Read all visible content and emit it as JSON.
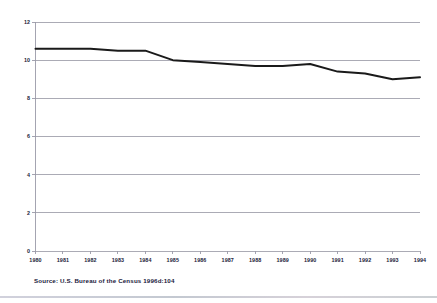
{
  "chart_data": {
    "type": "line",
    "title": "",
    "subtitle": "",
    "xlabel": "",
    "ylabel": "",
    "categories": [
      "1980",
      "1981",
      "1982",
      "1983",
      "1984",
      "1985",
      "1986",
      "1987",
      "1988",
      "1989",
      "1990",
      "1991",
      "1992",
      "1993",
      "1994"
    ],
    "x": [
      1980,
      1981,
      1982,
      1983,
      1984,
      1985,
      1986,
      1987,
      1988,
      1989,
      1990,
      1991,
      1992,
      1993,
      1994
    ],
    "values": [
      10.6,
      10.6,
      10.6,
      10.5,
      10.5,
      10.0,
      9.9,
      9.8,
      9.7,
      9.7,
      9.8,
      9.4,
      9.3,
      9.0,
      9.1
    ],
    "series": [
      {
        "name": "rate",
        "values": [
          10.6,
          10.6,
          10.6,
          10.5,
          10.5,
          10.0,
          9.9,
          9.8,
          9.7,
          9.7,
          9.8,
          9.4,
          9.3,
          9.0,
          9.1
        ]
      }
    ],
    "ylim": [
      0,
      12
    ],
    "yticks": [
      0,
      2,
      4,
      6,
      8,
      10,
      12
    ],
    "ytick_labels": [
      "0",
      "2",
      "4",
      "6",
      "8",
      "10",
      "12"
    ],
    "xtick_labels": [
      "1980",
      "1981",
      "1982",
      "1983",
      "1984",
      "1985",
      "1986",
      "1987",
      "1988",
      "1989",
      "1990",
      "1991",
      "1992",
      "1993",
      "1994"
    ],
    "grid": true,
    "grid_axis": "y",
    "legend": false,
    "legend_position": "none",
    "line_color": "#1a1a1a",
    "grid_color": "#8f8f9c",
    "axis_color": "#9a9aa8"
  },
  "source": {
    "note": "Source: U.S. Bureau of the Census 1996d:104"
  },
  "colors": {
    "background": "#ffffff",
    "line": "#1a1a1a",
    "grid": "#8f8f9c",
    "text": "#1c1c3a"
  }
}
